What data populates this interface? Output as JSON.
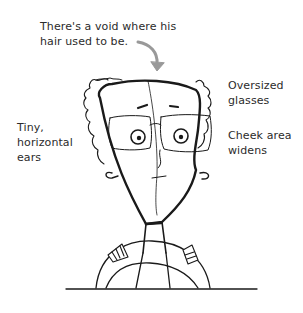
{
  "annotations": {
    "hair_void": {
      "lines": [
        "There's a void where his",
        "hair used to be."
      ]
    },
    "ears": {
      "lines": [
        "Tiny,",
        "horizontal",
        "ears"
      ]
    },
    "glasses": {
      "lines": [
        "Oversized",
        "glasses"
      ]
    },
    "cheek": {
      "lines": [
        "Cheek area",
        "widens"
      ]
    }
  },
  "colors": {
    "ink": "#1a1a1a",
    "text": "#2b2b2b",
    "arrow": "#999999",
    "background": "#ffffff"
  },
  "illustration": {
    "subject": "cartoon man with receding curly hair, oversized glasses, triangular face, holding steering wheel",
    "icons": [
      "curved-arrow-icon"
    ]
  }
}
